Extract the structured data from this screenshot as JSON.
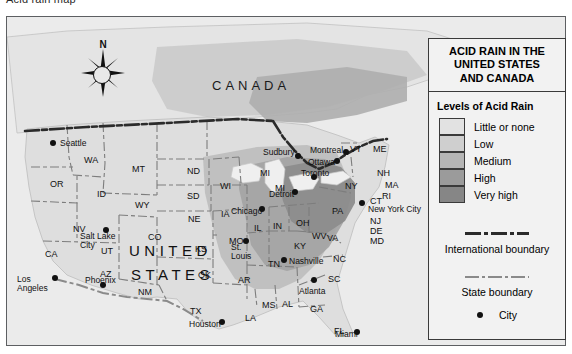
{
  "top_clip_text": "Acid rain map",
  "map": {
    "country_labels": [
      {
        "text": "CANADA",
        "x": 205,
        "y": 62
      }
    ],
    "big_words": [
      {
        "text": "UNITED",
        "x": 122,
        "y": 226
      },
      {
        "text": "STATES",
        "x": 124,
        "y": 250
      }
    ],
    "states": [
      {
        "abbr": "WA",
        "x": 77,
        "y": 139
      },
      {
        "abbr": "OR",
        "x": 43,
        "y": 163
      },
      {
        "abbr": "ID",
        "x": 90,
        "y": 173
      },
      {
        "abbr": "MT",
        "x": 125,
        "y": 148
      },
      {
        "abbr": "ND",
        "x": 180,
        "y": 150
      },
      {
        "abbr": "SD",
        "x": 180,
        "y": 175
      },
      {
        "abbr": "WY",
        "x": 128,
        "y": 184
      },
      {
        "abbr": "NE",
        "x": 181,
        "y": 198
      },
      {
        "abbr": "NV",
        "x": 66,
        "y": 208
      },
      {
        "abbr": "CA",
        "x": 38,
        "y": 233
      },
      {
        "abbr": "UT",
        "x": 94,
        "y": 230
      },
      {
        "abbr": "CO",
        "x": 141,
        "y": 216
      },
      {
        "abbr": "AZ",
        "x": 93,
        "y": 253
      },
      {
        "abbr": "NM",
        "x": 131,
        "y": 271
      },
      {
        "abbr": "KS",
        "x": 188,
        "y": 228
      },
      {
        "abbr": "OK",
        "x": 191,
        "y": 254
      },
      {
        "abbr": "TX",
        "x": 183,
        "y": 290
      },
      {
        "abbr": "IA",
        "x": 214,
        "y": 193
      },
      {
        "abbr": "MO",
        "x": 222,
        "y": 220
      },
      {
        "abbr": "AR",
        "x": 231,
        "y": 259
      },
      {
        "abbr": "LA",
        "x": 238,
        "y": 297
      },
      {
        "abbr": "MS",
        "x": 255,
        "y": 284
      },
      {
        "abbr": "AL",
        "x": 275,
        "y": 283
      },
      {
        "abbr": "GA",
        "x": 303,
        "y": 288
      },
      {
        "abbr": "FL",
        "x": 327,
        "y": 310
      },
      {
        "abbr": "SC",
        "x": 321,
        "y": 258
      },
      {
        "abbr": "NC",
        "x": 326,
        "y": 238
      },
      {
        "abbr": "TN",
        "x": 261,
        "y": 243
      },
      {
        "abbr": "KY",
        "x": 287,
        "y": 225
      },
      {
        "abbr": "WI",
        "x": 213,
        "y": 165
      },
      {
        "abbr": "MI",
        "x": 253,
        "y": 152
      },
      {
        "abbr": "MI",
        "x": 268,
        "y": 167
      },
      {
        "abbr": "IL",
        "x": 247,
        "y": 207
      },
      {
        "abbr": "IN",
        "x": 266,
        "y": 205
      },
      {
        "abbr": "OH",
        "x": 289,
        "y": 202
      },
      {
        "abbr": "WV",
        "x": 305,
        "y": 215
      },
      {
        "abbr": "VA",
        "x": 320,
        "y": 217
      },
      {
        "abbr": "PA",
        "x": 325,
        "y": 190
      },
      {
        "abbr": "NY",
        "x": 338,
        "y": 165
      },
      {
        "abbr": "VT",
        "x": 343,
        "y": 128
      },
      {
        "abbr": "ME",
        "x": 366,
        "y": 128
      },
      {
        "abbr": "NH",
        "x": 370,
        "y": 152
      },
      {
        "abbr": "MA",
        "x": 378,
        "y": 164
      },
      {
        "abbr": "RI",
        "x": 375,
        "y": 175
      },
      {
        "abbr": "CT",
        "x": 363,
        "y": 180
      },
      {
        "abbr": "NJ",
        "x": 363,
        "y": 200
      },
      {
        "abbr": "DE",
        "x": 363,
        "y": 210
      },
      {
        "abbr": "MD",
        "x": 363,
        "y": 220
      }
    ],
    "cities": [
      {
        "name": "Seattle",
        "dot_x": 46,
        "dot_y": 126,
        "label_x": 53,
        "label_y": 122,
        "lines": [
          "Seattle"
        ]
      },
      {
        "name": "Los Angeles",
        "dot_x": 48,
        "dot_y": 261,
        "label_x": 10,
        "label_y": 258,
        "lines": [
          "Los",
          "Angeles"
        ]
      },
      {
        "name": "Salt Lake City",
        "dot_x": 99,
        "dot_y": 213,
        "label_x": 73,
        "label_y": 215,
        "lines": [
          "Salt Lake",
          "City"
        ]
      },
      {
        "name": "Phoenix",
        "dot_x": 96,
        "dot_y": 268,
        "label_x": 78,
        "label_y": 259,
        "lines": [
          "Phoenix"
        ]
      },
      {
        "name": "Houston",
        "dot_x": 215,
        "dot_y": 305,
        "label_x": 182,
        "label_y": 303,
        "lines": [
          "Houston"
        ]
      },
      {
        "name": "Chicago",
        "dot_x": 255,
        "dot_y": 192,
        "label_x": 224,
        "label_y": 190,
        "lines": [
          "Chicago"
        ]
      },
      {
        "name": "St. Louis",
        "dot_x": 239,
        "dot_y": 224,
        "label_x": 224,
        "label_y": 226,
        "lines": [
          "St.",
          "Louis"
        ]
      },
      {
        "name": "Nashville",
        "dot_x": 277,
        "dot_y": 243,
        "label_x": 282,
        "label_y": 240,
        "lines": [
          "Nashville"
        ]
      },
      {
        "name": "Atlanta",
        "dot_x": 307,
        "dot_y": 263,
        "label_x": 292,
        "label_y": 270,
        "lines": [
          "Atlanta"
        ]
      },
      {
        "name": "Miami",
        "dot_x": 350,
        "dot_y": 315,
        "label_x": 328,
        "label_y": 313,
        "lines": [
          "Miami"
        ]
      },
      {
        "name": "Detroit",
        "dot_x": 288,
        "dot_y": 175,
        "label_x": 262,
        "label_y": 173,
        "lines": [
          "Detroit"
        ]
      },
      {
        "name": "Sudbury",
        "dot_x": 291,
        "dot_y": 139,
        "label_x": 256,
        "label_y": 131,
        "lines": [
          "Sudbury"
        ]
      },
      {
        "name": "Toronto",
        "dot_x": 307,
        "dot_y": 160,
        "label_x": 294,
        "label_y": 152,
        "lines": [
          "Toronto"
        ]
      },
      {
        "name": "Ottawa",
        "dot_x": 330,
        "dot_y": 144,
        "label_x": 301,
        "label_y": 141,
        "lines": [
          "Ottawa"
        ]
      },
      {
        "name": "Montreal",
        "dot_x": 339,
        "dot_y": 135,
        "label_x": 303,
        "label_y": 129,
        "lines": [
          "Montreal"
        ]
      },
      {
        "name": "New York City",
        "dot_x": 355,
        "dot_y": 186,
        "label_x": 361,
        "label_y": 188,
        "lines": [
          "New York City"
        ]
      }
    ],
    "compass_label": "N"
  },
  "legend": {
    "title_lines": [
      "ACID RAIN IN THE",
      "UNITED STATES",
      "AND CANADA"
    ],
    "levels_heading": "Levels of Acid Rain",
    "levels": [
      {
        "label": "Little or none",
        "color": "#e2e2e2"
      },
      {
        "label": "Low",
        "color": "#cfcfcf"
      },
      {
        "label": "Medium",
        "color": "#b5b5b5"
      },
      {
        "label": "High",
        "color": "#9b9b9b"
      },
      {
        "label": "Very high",
        "color": "#868686"
      }
    ],
    "international_boundary_label": "International boundary",
    "state_boundary_label": "State boundary",
    "city_label": "City"
  }
}
